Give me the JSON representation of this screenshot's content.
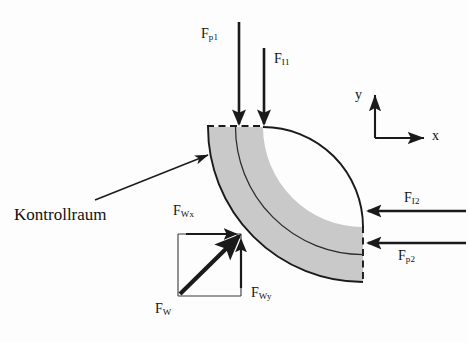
{
  "figure": {
    "background_color": "#fdfdfd",
    "stroke_color": "#1a1a1a",
    "fill_color": "#c9c9c9"
  },
  "caption": {
    "text": "Kontrollraum"
  },
  "axes": {
    "x_label": "x",
    "y_label": "y"
  },
  "forces": [
    {
      "id": "Fp1",
      "symbol": "F",
      "subscript": "p1",
      "direction": "down",
      "position": "inlet-top-left"
    },
    {
      "id": "FI1",
      "symbol": "F",
      "subscript": "I1",
      "direction": "down",
      "position": "inlet-top-right"
    },
    {
      "id": "FI2",
      "symbol": "F",
      "subscript": "I2",
      "direction": "left",
      "position": "outlet-right-upper"
    },
    {
      "id": "Fp2",
      "symbol": "F",
      "subscript": "p2",
      "direction": "left",
      "position": "outlet-right-lower"
    },
    {
      "id": "FWx",
      "symbol": "F",
      "subscript": "Wx",
      "direction": "right",
      "position": "component-horizontal"
    },
    {
      "id": "FWy",
      "symbol": "F",
      "subscript": "Wy",
      "direction": "up",
      "position": "component-vertical"
    },
    {
      "id": "FW",
      "symbol": "F",
      "subscript": "W",
      "direction": "diagonal-up-right",
      "position": "resultant"
    }
  ]
}
